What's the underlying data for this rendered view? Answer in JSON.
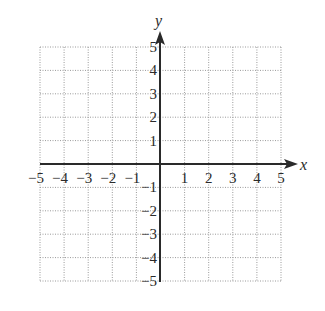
{
  "chart_data": {
    "type": "scatter",
    "title": "",
    "xlabel": "x",
    "ylabel": "y",
    "xlim": [
      -5,
      5
    ],
    "ylim": [
      -5,
      5
    ],
    "grid": true,
    "grid_style": "dotted",
    "x_ticks": [
      -5,
      -4,
      -3,
      -2,
      -1,
      1,
      2,
      3,
      4,
      5
    ],
    "y_ticks": [
      -5,
      -4,
      -3,
      -2,
      -1,
      1,
      2,
      3,
      4,
      5
    ],
    "x_tick_labels": [
      "−5",
      "−4",
      "−3",
      "−2",
      "−1",
      "1",
      "2",
      "3",
      "4",
      "5"
    ],
    "y_tick_labels": [
      "−5",
      "−4",
      "−3",
      "−2",
      "−1",
      "1",
      "2",
      "3",
      "4",
      "5"
    ],
    "series": [],
    "legend": null
  },
  "colors": {
    "axis": "#2a2a2a",
    "grid": "#9a9a9a",
    "background": "#ffffff"
  }
}
